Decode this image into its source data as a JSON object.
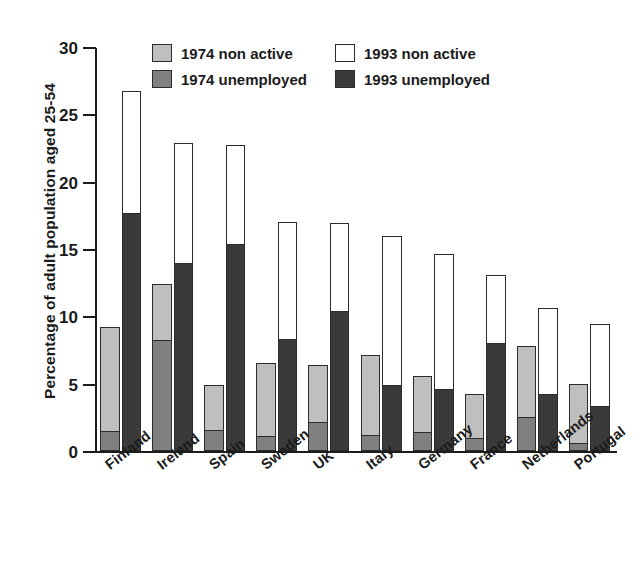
{
  "chart_data": {
    "type": "bar",
    "title": "",
    "subtitle": "",
    "xlabel": "",
    "ylabel": "Percentage of adult population aged 25-54",
    "ylim": [
      0,
      30
    ],
    "yticks": [
      0,
      5,
      10,
      15,
      20,
      25,
      30
    ],
    "ytick_labels": [
      "0",
      "5",
      "10",
      "15",
      "20",
      "25",
      "30"
    ],
    "grid": false,
    "legend_position": "top-center",
    "grouping": "two bars per country, each stacked (unemployed at base, non active above)",
    "categories": [
      "Finland",
      "Ireland",
      "Spain",
      "Sweden",
      "UK",
      "Italy",
      "Germany",
      "France",
      "Netherlands",
      "Portugal"
    ],
    "legend": [
      {
        "label": "1974 non active",
        "color": "#bfbfbf"
      },
      {
        "label": "1974 unemployed",
        "color": "#808080"
      },
      {
        "label": "1993 non active",
        "color": "#ffffff"
      },
      {
        "label": "1993 unemployed",
        "color": "#3a3a3a"
      }
    ],
    "series": [
      {
        "name": "1974 unemployed",
        "color": "#808080",
        "values": [
          1.4,
          8.3,
          1.5,
          1.1,
          2.1,
          1.1,
          1.4,
          0.9,
          2.5,
          0.5
        ]
      },
      {
        "name": "1974 non active",
        "color": "#bfbfbf",
        "values": [
          7.8,
          4.1,
          3.4,
          5.4,
          4.3,
          6.0,
          4.2,
          3.3,
          5.3,
          4.5
        ]
      },
      {
        "name": "1993 unemployed",
        "color": "#3a3a3a",
        "values": [
          17.7,
          14.0,
          15.4,
          8.3,
          10.4,
          4.9,
          4.6,
          8.0,
          4.2,
          3.3
        ]
      },
      {
        "name": "1993 non active",
        "color": "#ffffff",
        "values": [
          9.0,
          8.9,
          7.3,
          8.7,
          6.5,
          11.1,
          10.0,
          5.1,
          6.4,
          6.1
        ]
      }
    ],
    "totals_1974": [
      9.2,
      12.4,
      4.9,
      6.5,
      6.4,
      7.1,
      5.6,
      4.2,
      7.8,
      5.0
    ],
    "totals_1993": [
      26.7,
      22.9,
      22.7,
      17.0,
      16.9,
      16.0,
      14.6,
      13.1,
      10.6,
      9.4
    ]
  }
}
